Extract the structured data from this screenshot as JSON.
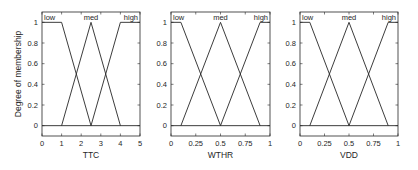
{
  "chart_data": [
    {
      "type": "line",
      "title": "",
      "xlabel": "TTC",
      "ylabel": "Degree of membership",
      "xlim": [
        0,
        5
      ],
      "ylim": [
        -0.1,
        1.1
      ],
      "xticks": [
        "0",
        "1",
        "2",
        "3",
        "4",
        "5"
      ],
      "yticks": [
        "0",
        "0.2",
        "0.4",
        "0.6",
        "0.8",
        "1"
      ],
      "series": [
        {
          "name": "low",
          "x": [
            0,
            1,
            2.5
          ],
          "y": [
            1,
            1,
            0
          ]
        },
        {
          "name": "med",
          "x": [
            1,
            2.5,
            4
          ],
          "y": [
            0,
            1,
            0
          ]
        },
        {
          "name": "high",
          "x": [
            2.5,
            4,
            5
          ],
          "y": [
            0,
            1,
            1
          ]
        }
      ]
    },
    {
      "type": "line",
      "title": "",
      "xlabel": "WTHR",
      "ylabel": "",
      "xlim": [
        0,
        1
      ],
      "ylim": [
        -0.1,
        1.1
      ],
      "xticks": [
        "0",
        "0.25",
        "0.5",
        "0.75",
        "1"
      ],
      "yticks": [
        "0",
        "0.2",
        "0.4",
        "0.6",
        "0.8",
        "1"
      ],
      "series": [
        {
          "name": "low",
          "x": [
            0,
            0.1,
            0.5
          ],
          "y": [
            1,
            1,
            0
          ]
        },
        {
          "name": "med",
          "x": [
            0.1,
            0.5,
            0.9
          ],
          "y": [
            0,
            1,
            0
          ]
        },
        {
          "name": "high",
          "x": [
            0.5,
            0.9,
            1
          ],
          "y": [
            0,
            1,
            1
          ]
        }
      ]
    },
    {
      "type": "line",
      "title": "",
      "xlabel": "VDD",
      "ylabel": "",
      "xlim": [
        0,
        1
      ],
      "ylim": [
        -0.1,
        1.1
      ],
      "xticks": [
        "0",
        "0.25",
        "0.5",
        "0.75",
        "1"
      ],
      "yticks": [
        "0",
        "0.2",
        "0.4",
        "0.6",
        "0.8",
        "1"
      ],
      "series": [
        {
          "name": "low",
          "x": [
            0,
            0.1,
            0.5
          ],
          "y": [
            1,
            1,
            0
          ]
        },
        {
          "name": "med",
          "x": [
            0.1,
            0.5,
            0.9
          ],
          "y": [
            0,
            1,
            0
          ]
        },
        {
          "name": "high",
          "x": [
            0.5,
            0.9,
            1
          ],
          "y": [
            0,
            1,
            1
          ]
        }
      ]
    }
  ],
  "colors": {
    "line": "#262626",
    "frame": "#262626",
    "background": "#ffffff"
  }
}
